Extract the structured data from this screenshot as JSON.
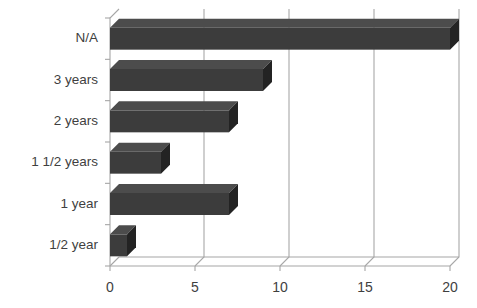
{
  "chart_data": {
    "type": "bar",
    "orientation": "horizontal",
    "style": "3d",
    "title": "",
    "subtitle": "",
    "xlabel": "",
    "ylabel": "",
    "categories": [
      "1/2 year",
      "1 year",
      "1 1/2 years",
      "2 years",
      "3 years",
      "N/A"
    ],
    "values": [
      1,
      7,
      3,
      7,
      9,
      20
    ],
    "series": [
      {
        "name": "Count",
        "values": [
          1,
          7,
          3,
          7,
          9,
          20
        ]
      }
    ],
    "xlim": [
      0,
      20
    ],
    "ylim": null,
    "xticks": [
      0,
      5,
      10,
      15,
      20
    ],
    "xtick_labels": [
      "0",
      "5",
      "10",
      "15",
      "20"
    ],
    "ytick_labels": [
      "N/A",
      "3 years",
      "2 years",
      "1 1/2 years",
      "1 year",
      "1/2 year"
    ],
    "grid": true,
    "grid_axis": "x",
    "legend": false,
    "legend_position": "none",
    "annotations": [],
    "colors": {
      "bar_front": "#3c3c3c",
      "bar_top": "#4c4c4c",
      "bar_side": "#232323",
      "axis": "#a6a6a6",
      "grid": "#a8a8a8",
      "text": "#3f3f3f",
      "background": "#ffffff"
    }
  },
  "axes": {
    "y_labels": [
      {
        "text": "N/A"
      },
      {
        "text": "3 years"
      },
      {
        "text": "2 years"
      },
      {
        "text": "1 1/2 years"
      },
      {
        "text": "1 year"
      },
      {
        "text": "1/2 year"
      }
    ],
    "x_labels": [
      {
        "text": "0"
      },
      {
        "text": "5"
      },
      {
        "text": "10"
      },
      {
        "text": "15"
      },
      {
        "text": "20"
      }
    ]
  }
}
